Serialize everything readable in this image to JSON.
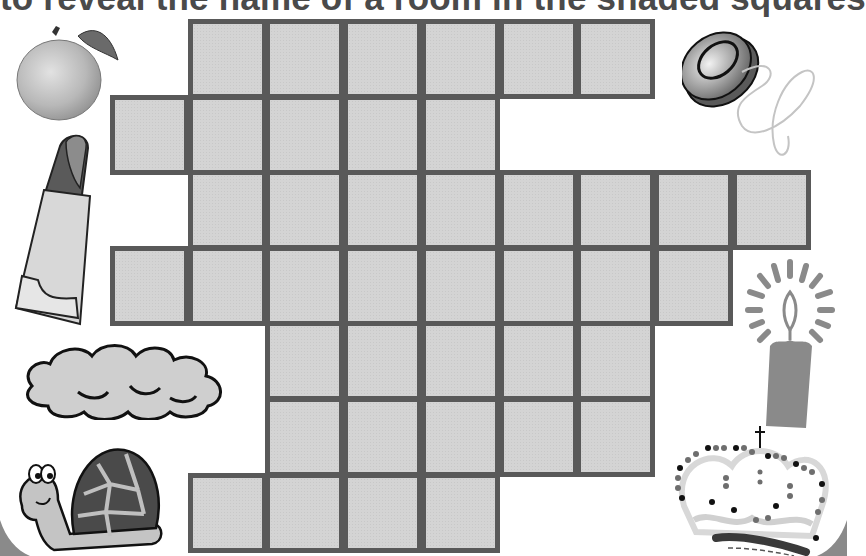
{
  "title": "to reveal the name of a room in the shaded squares",
  "colors": {
    "cell_fill": "#d4d4d4",
    "cell_border": "#595959",
    "title": "#4a4a4a",
    "background": "#ffffff"
  },
  "grid": {
    "origin_x": 110,
    "origin_y": 19,
    "cell_pitch_x": 77.7,
    "cell_pitch_y": 75.6,
    "rows": [
      {
        "row": 1,
        "start_col": 2,
        "end_col": 7,
        "cells": 6
      },
      {
        "row": 2,
        "start_col": 1,
        "end_col": 5,
        "cells": 5
      },
      {
        "row": 3,
        "start_col": 2,
        "end_col": 9,
        "cells": 8
      },
      {
        "row": 4,
        "start_col": 1,
        "end_col": 8,
        "cells": 8
      },
      {
        "row": 5,
        "start_col": 3,
        "end_col": 7,
        "cells": 5
      },
      {
        "row": 6,
        "start_col": 3,
        "end_col": 7,
        "cells": 5
      },
      {
        "row": 7,
        "start_col": 2,
        "end_col": 5,
        "cells": 4
      }
    ]
  },
  "pictures": [
    {
      "name": "peach",
      "icon": "peach-icon",
      "side": "left"
    },
    {
      "name": "lipstick",
      "icon": "lipstick-icon",
      "side": "left"
    },
    {
      "name": "cloud",
      "icon": "cloud-icon",
      "side": "left"
    },
    {
      "name": "tortoise",
      "icon": "tortoise-icon",
      "side": "left"
    },
    {
      "name": "yo-yo",
      "icon": "yoyo-icon",
      "side": "right"
    },
    {
      "name": "candle",
      "icon": "candle-icon",
      "side": "right"
    },
    {
      "name": "crown",
      "icon": "crown-icon",
      "side": "right"
    }
  ]
}
